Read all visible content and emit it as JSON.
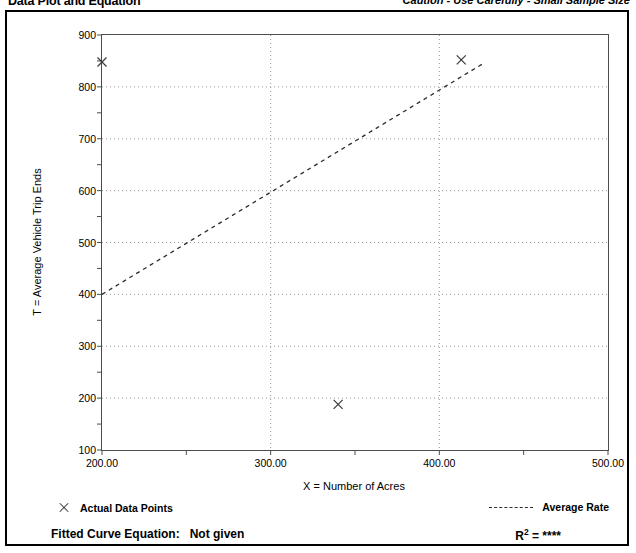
{
  "header": {
    "title": "Data Plot and Equation",
    "caution": "Caution - Use Carefully - Small Sample Size"
  },
  "legend": {
    "points_label": "Actual Data Points",
    "rate_label": "Average Rate",
    "point_marker_icon": "x-marker-icon",
    "rate_line_icon": "dashed-line-icon"
  },
  "footer": {
    "fitted_label": "Fitted Curve Equation:",
    "fitted_value": "Not given",
    "rsq_prefix": "R",
    "rsq_exponent": "2",
    "rsq_equals": "=",
    "rsq_value": "****"
  },
  "chart_data": {
    "type": "scatter",
    "title": "Data Plot and Equation",
    "xlabel": "X = Number of Acres",
    "ylabel": "T = Average Vehicle Trip Ends",
    "xlim": [
      200,
      500
    ],
    "ylim": [
      100,
      900
    ],
    "xticks": [
      200,
      250,
      300,
      350,
      400,
      450,
      500
    ],
    "xtick_labels": [
      "200.00",
      "",
      "300.00",
      "",
      "400.00",
      "",
      "500.00"
    ],
    "yticks": [
      100,
      150,
      200,
      250,
      300,
      350,
      400,
      450,
      500,
      550,
      600,
      650,
      700,
      750,
      800,
      850,
      900
    ],
    "ytick_labels": [
      "100",
      "",
      "200",
      "",
      "300",
      "",
      "400",
      "",
      "500",
      "",
      "600",
      "",
      "700",
      "",
      "800",
      "",
      "900"
    ],
    "grid": true,
    "grid_style": "dotted",
    "grid_x": [
      300,
      400
    ],
    "grid_y": [
      200,
      300,
      400,
      500,
      600,
      700,
      800
    ],
    "legend_position": "below-plot",
    "series": [
      {
        "name": "Actual Data Points",
        "type": "scatter",
        "marker": "x",
        "points": [
          {
            "x": 200,
            "y": 848
          },
          {
            "x": 340,
            "y": 188
          },
          {
            "x": 413,
            "y": 852
          }
        ]
      },
      {
        "name": "Average Rate",
        "type": "line",
        "style": "dashed",
        "points": [
          {
            "x": 200,
            "y": 400
          },
          {
            "x": 427,
            "y": 847
          }
        ]
      }
    ]
  },
  "colors": {
    "border": "#000000",
    "axis": "#4c4c4c",
    "grid": "#9a9a9a",
    "marker": "#3c3c3c",
    "trend": "#2b2b2b",
    "background": "#ffffff"
  }
}
